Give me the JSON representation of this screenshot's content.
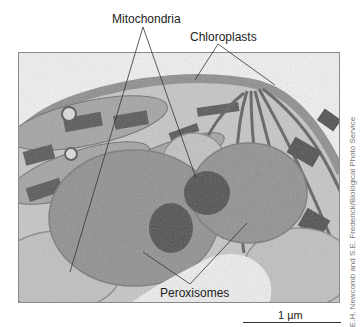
{
  "figure": {
    "labels": {
      "mitochondria": "Mitochondria",
      "chloroplasts": "Chloroplasts",
      "peroxisomes": "Peroxisomes"
    },
    "credit": "E.H. Newcomb and S.E. Frederick/Biological Photo Service",
    "scale_bar": {
      "label": "1 µm"
    },
    "colors": {
      "background": "#ffffff",
      "cytoplasm": "#c9c9c9",
      "chloroplast_stroma": "#a8a8a8",
      "grana": "#5a5a5a",
      "peroxisome": "#8e8e8e",
      "crystalline_core": "#4e4e4e",
      "mitochondrion": "#bdbdbd",
      "vacuole": "#eeeeee",
      "label_lines": "#333333"
    }
  }
}
